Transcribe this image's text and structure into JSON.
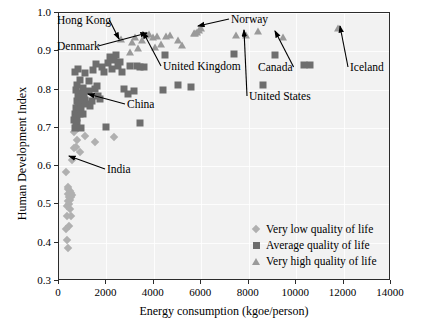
{
  "chart_data": {
    "type": "scatter",
    "title": "",
    "xlabel": "Energy consumption (kgoe/person)",
    "ylabel": "Human Development Index",
    "xlim": [
      0,
      14000
    ],
    "ylim": [
      0.3,
      1.0
    ],
    "xticks": [
      0,
      2000,
      4000,
      6000,
      8000,
      10000,
      12000,
      14000
    ],
    "xtick_labels": [
      "0",
      "2000",
      "4000",
      "6000",
      "8000",
      "10000",
      "12000",
      "14000"
    ],
    "yticks": [
      0.3,
      0.4,
      0.5,
      0.6,
      0.7,
      0.8,
      0.9,
      1.0
    ],
    "ytick_labels": [
      "0.3",
      "0.4",
      "0.5",
      "0.6",
      "0.7",
      "0.8",
      "0.9",
      "1.0"
    ],
    "grid": true,
    "legend_position": "lower right",
    "series": [
      {
        "name": "Very low quality of life",
        "marker": "diamond",
        "color": "#b0b0b0",
        "points": [
          [
            320,
            0.408
          ],
          [
            390,
            0.386
          ],
          [
            300,
            0.437
          ],
          [
            420,
            0.443
          ],
          [
            350,
            0.47
          ],
          [
            520,
            0.47
          ],
          [
            330,
            0.497
          ],
          [
            380,
            0.508
          ],
          [
            440,
            0.519
          ],
          [
            470,
            0.512
          ],
          [
            500,
            0.53
          ],
          [
            360,
            0.541
          ],
          [
            400,
            0.546
          ],
          [
            560,
            0.524
          ],
          [
            300,
            0.585
          ],
          [
            520,
            0.519
          ],
          [
            430,
            0.5
          ],
          [
            470,
            0.489
          ],
          [
            560,
            0.616
          ],
          [
            620,
            0.648
          ],
          [
            720,
            0.651
          ],
          [
            900,
            0.637
          ],
          [
            1090,
            0.678
          ],
          [
            1500,
            0.662
          ],
          [
            2300,
            0.675
          ],
          [
            640,
            0.69
          ],
          [
            760,
            0.667
          ],
          [
            820,
            0.7
          ],
          [
            360,
            0.527
          ],
          [
            470,
            0.536
          ]
        ]
      },
      {
        "name": "Average quality of life",
        "marker": "square",
        "color": "#6e6e6e",
        "points": [
          [
            620,
            0.72
          ],
          [
            660,
            0.735
          ],
          [
            700,
            0.706
          ],
          [
            720,
            0.752
          ],
          [
            740,
            0.726
          ],
          [
            760,
            0.771
          ],
          [
            780,
            0.744
          ],
          [
            800,
            0.762
          ],
          [
            820,
            0.786
          ],
          [
            840,
            0.757
          ],
          [
            860,
            0.775
          ],
          [
            880,
            0.736
          ],
          [
            900,
            0.792
          ],
          [
            920,
            0.766
          ],
          [
            940,
            0.748
          ],
          [
            960,
            0.781
          ],
          [
            700,
            0.798
          ],
          [
            740,
            0.812
          ],
          [
            680,
            0.845
          ],
          [
            820,
            0.853
          ],
          [
            900,
            0.826
          ],
          [
            1000,
            0.804
          ],
          [
            1060,
            0.789
          ],
          [
            1100,
            0.772
          ],
          [
            1180,
            0.762
          ],
          [
            1250,
            0.797
          ],
          [
            1300,
            0.757
          ],
          [
            1380,
            0.77
          ],
          [
            1450,
            0.85
          ],
          [
            1500,
            0.802
          ],
          [
            1580,
            0.866
          ],
          [
            1650,
            0.783
          ],
          [
            1720,
            0.775
          ],
          [
            1800,
            0.86
          ],
          [
            1900,
            0.845
          ],
          [
            1980,
            0.703
          ],
          [
            2050,
            0.869
          ],
          [
            2150,
            0.884
          ],
          [
            2250,
            0.855
          ],
          [
            2320,
            0.878
          ],
          [
            2400,
            0.89
          ],
          [
            2480,
            0.862
          ],
          [
            2560,
            0.872
          ],
          [
            2650,
            0.846
          ],
          [
            2750,
            0.802
          ],
          [
            2900,
            0.788
          ],
          [
            3000,
            0.862
          ],
          [
            3150,
            0.795
          ],
          [
            3280,
            0.862
          ],
          [
            3400,
            0.86
          ],
          [
            3420,
            0.712
          ],
          [
            3600,
            0.859
          ],
          [
            4400,
            0.8
          ],
          [
            4480,
            0.89
          ],
          [
            5000,
            0.812
          ],
          [
            5550,
            0.808
          ],
          [
            7400,
            0.892
          ],
          [
            8600,
            0.812
          ],
          [
            9100,
            0.889
          ],
          [
            10350,
            0.864
          ],
          [
            10600,
            0.864
          ],
          [
            1620,
            0.81
          ],
          [
            1080,
            0.842
          ],
          [
            1260,
            0.822
          ],
          [
            780,
            0.712
          ],
          [
            660,
            0.7
          ],
          [
            920,
            0.7
          ],
          [
            1000,
            0.735
          ]
        ]
      },
      {
        "name": "Very high quality of life",
        "marker": "triangle",
        "color": "#9a9a9a",
        "points": [
          [
            2620,
            0.933
          ],
          [
            3000,
            0.898
          ],
          [
            3200,
            0.937
          ],
          [
            3350,
            0.908
          ],
          [
            3500,
            0.93
          ],
          [
            3650,
            0.942
          ],
          [
            3800,
            0.946
          ],
          [
            3950,
            0.938
          ],
          [
            4150,
            0.941
          ],
          [
            4300,
            0.92
          ],
          [
            4500,
            0.94
          ],
          [
            4700,
            0.943
          ],
          [
            5000,
            0.93
          ],
          [
            5200,
            0.917
          ],
          [
            5700,
            0.948
          ],
          [
            5750,
            0.949
          ],
          [
            5800,
            0.951
          ],
          [
            5900,
            0.955
          ],
          [
            6000,
            0.96
          ],
          [
            7450,
            0.943
          ],
          [
            7900,
            0.942
          ],
          [
            8400,
            0.953
          ],
          [
            9450,
            0.938
          ],
          [
            11750,
            0.961
          ],
          [
            3080,
            0.925
          ],
          [
            4050,
            0.912
          ]
        ]
      }
    ],
    "annotations": [
      {
        "label": "Hong Kong",
        "label_x": 57,
        "label_y": 14,
        "tip_x": 119,
        "tip_y": 39
      },
      {
        "label": "Denmark",
        "label_x": 57,
        "label_y": 40,
        "tip_x": 147,
        "tip_y": 33
      },
      {
        "label": "Norway",
        "label_x": 231,
        "label_y": 13,
        "tip_x": 198,
        "tip_y": 26
      },
      {
        "label": "United Kingdom",
        "label_x": 163,
        "label_y": 60,
        "tip_x": 143,
        "tip_y": 32
      },
      {
        "label": "Canada",
        "label_x": 258,
        "label_y": 61,
        "tip_x": 275,
        "tip_y": 31
      },
      {
        "label": "United States",
        "label_x": 249,
        "label_y": 90,
        "tip_x": 244,
        "tip_y": 30
      },
      {
        "label": "Iceland",
        "label_x": 350,
        "label_y": 61,
        "tip_x": 340,
        "tip_y": 26
      },
      {
        "label": "China",
        "label_x": 127,
        "label_y": 98,
        "tip_x": 88,
        "tip_y": 94
      },
      {
        "label": "India",
        "label_x": 107,
        "label_y": 163,
        "tip_x": 69,
        "tip_y": 156
      }
    ],
    "legend": [
      {
        "label": "Very low quality of life",
        "marker": "diamond"
      },
      {
        "label": "Average quality of life",
        "marker": "square"
      },
      {
        "label": "Very high quality of life",
        "marker": "triangle"
      }
    ]
  }
}
